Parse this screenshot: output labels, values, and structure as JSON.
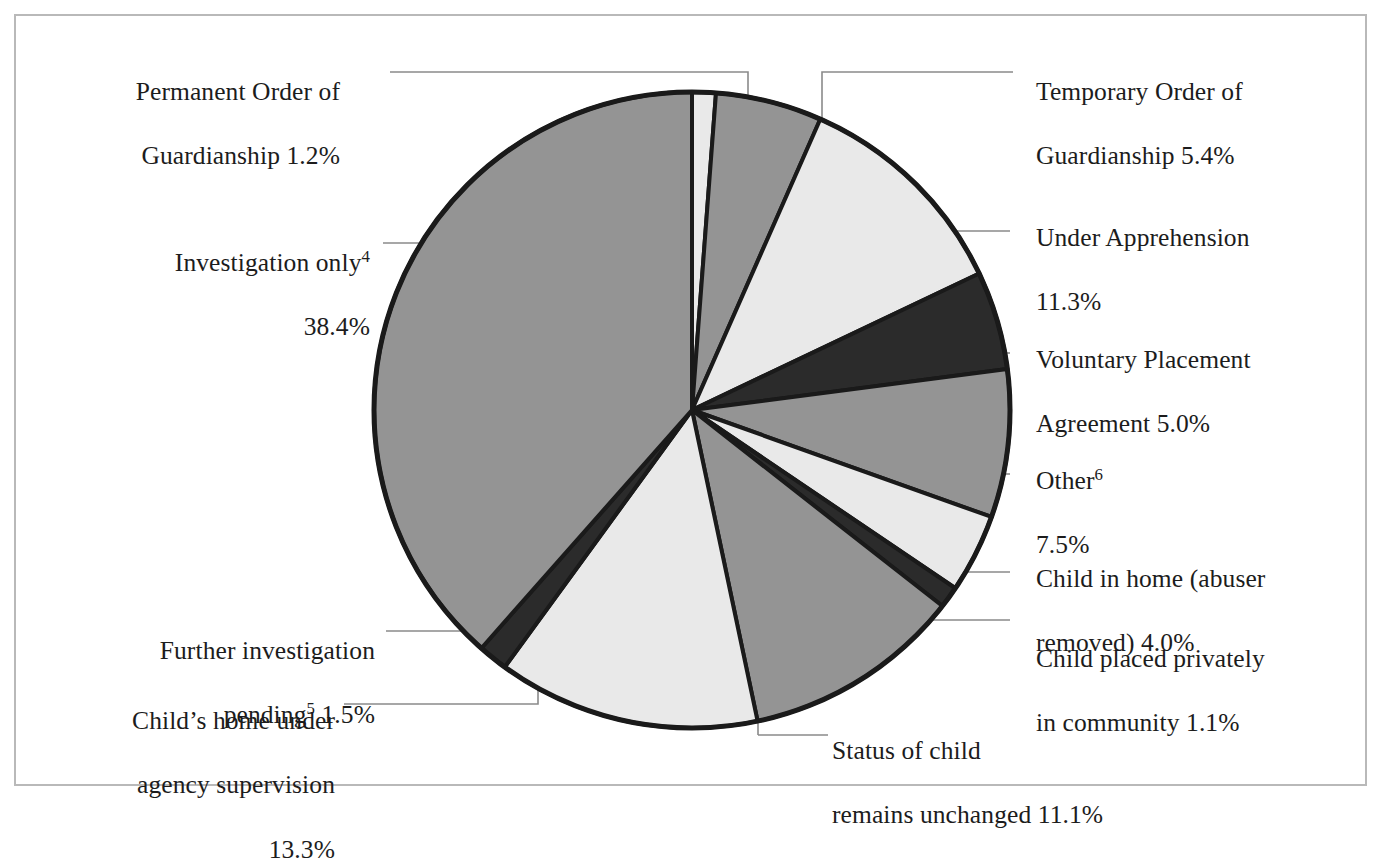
{
  "figure": {
    "frame_border_color": "#b9b9b9",
    "background": "#ffffff"
  },
  "chart_data": {
    "type": "pie",
    "title": "",
    "subtitle": "",
    "xlabel": "",
    "ylabel": "",
    "legend_position": "callout-labels",
    "grid": false,
    "start_angle_deg": 0,
    "direction": "clockwise",
    "center": {
      "x": 692,
      "y": 410
    },
    "radius": 318,
    "slice_stroke": "#1a1a1a",
    "slice_stroke_width": 4,
    "total_percent": 99.8,
    "categories": [
      "Permanent Order of Guardianship",
      "Temporary Order of Guardianship",
      "Under Apprehension",
      "Voluntary Placement Agreement",
      "Other",
      "Child in home (abuser removed)",
      "Child placed privately in community",
      "Status of child remains unchanged",
      "Child's home under agency supervision",
      "Further investigation pending",
      "Investigation only"
    ],
    "values": [
      1.2,
      5.4,
      11.3,
      5.0,
      7.5,
      4.0,
      1.1,
      11.1,
      13.3,
      1.5,
      38.4
    ],
    "colors": [
      "#e9e9e9",
      "#949494",
      "#e9e9e9",
      "#2b2b2b",
      "#949494",
      "#e9e9e9",
      "#2b2b2b",
      "#949494",
      "#e9e9e9",
      "#2b2b2b",
      "#949494"
    ],
    "slices": [
      {
        "label": "Permanent Order of Guardianship",
        "value": 1.2,
        "color": "#e9e9e9"
      },
      {
        "label": "Temporary Order of Guardianship",
        "value": 5.4,
        "color": "#949494"
      },
      {
        "label": "Under Apprehension",
        "value": 11.3,
        "color": "#e9e9e9"
      },
      {
        "label": "Voluntary Placement Agreement",
        "value": 5.0,
        "color": "#2b2b2b"
      },
      {
        "label": "Other",
        "value": 7.5,
        "color": "#949494"
      },
      {
        "label": "Child in home (abuser removed)",
        "value": 4.0,
        "color": "#e9e9e9"
      },
      {
        "label": "Child placed privately in community",
        "value": 1.1,
        "color": "#2b2b2b"
      },
      {
        "label": "Status of child remains unchanged",
        "value": 11.1,
        "color": "#949494"
      },
      {
        "label": "Child's home under agency supervision",
        "value": 13.3,
        "color": "#e9e9e9"
      },
      {
        "label": "Further investigation pending",
        "value": 1.5,
        "color": "#2b2b2b"
      },
      {
        "label": "Investigation only",
        "value": 38.4,
        "color": "#949494"
      }
    ]
  },
  "labels": {
    "permanent_order": {
      "line1": "Permanent Order of",
      "line2": "Guardianship 1.2%",
      "percent": "1.2%"
    },
    "investigation_only": {
      "line1_text": "Investigation only",
      "line1_sup": "4",
      "line2": "38.4%",
      "percent": "38.4%"
    },
    "further_investigation": {
      "line1": "Further investigation",
      "line2_text": "pending",
      "line2_sup": "5",
      "line2_tail": " 1.5%",
      "percent": "1.5%"
    },
    "childs_home": {
      "line1": "Child’s home under",
      "line2": "agency supervision",
      "line3": "13.3%",
      "percent": "13.3%"
    },
    "status_unchanged": {
      "line1": "Status of child",
      "line2": "remains unchanged 11.1%",
      "percent": "11.1%"
    },
    "temporary_order": {
      "line1": "Temporary Order of",
      "line2": "Guardianship 5.4%",
      "percent": "5.4%"
    },
    "under_apprehension": {
      "line1": "Under Apprehension",
      "line2": "11.3%",
      "percent": "11.3%"
    },
    "voluntary_placement": {
      "line1": "Voluntary Placement",
      "line2": "Agreement 5.0%",
      "percent": "5.0%"
    },
    "other": {
      "line1_text": "Other",
      "line1_sup": "6",
      "line2": "7.5%",
      "percent": "7.5%"
    },
    "child_in_home": {
      "line1": "Child in home (abuser",
      "line2": "removed) 4.0%",
      "percent": "4.0%"
    },
    "child_placed_privately": {
      "line1": "Child placed privately",
      "line2": "in community 1.1%",
      "percent": "1.1%"
    }
  },
  "leader_lines": [
    {
      "name": "leader-permanent-order",
      "points": "390,72 748,72 748,100"
    },
    {
      "name": "leader-investigation-only",
      "points": "383,243 447,243"
    },
    {
      "name": "leader-further-invest",
      "points": "386,631 538,631 538,607"
    },
    {
      "name": "leader-childs-home",
      "points": "344,704 538,704 538,690"
    },
    {
      "name": "leader-status-unchanged",
      "points": "758,735 758,700"
    },
    {
      "name": "leader-status-unchanged-2",
      "points": "758,735 828,735"
    },
    {
      "name": "leader-temporary-order",
      "points": "1013,72 822,72 822,130"
    },
    {
      "name": "leader-under-apprehension",
      "points": "1010,231 953,231"
    },
    {
      "name": "leader-voluntary",
      "points": "1010,353 1000,353"
    },
    {
      "name": "leader-other",
      "points": "1010,474 996,474"
    },
    {
      "name": "leader-child-in-home",
      "points": "1010,572 962,572"
    },
    {
      "name": "leader-child-privately",
      "points": "1010,620 930,620"
    }
  ]
}
